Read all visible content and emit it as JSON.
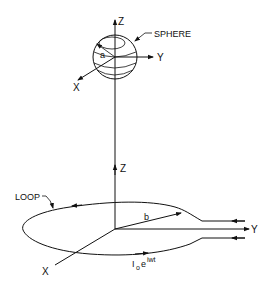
{
  "figure": {
    "type": "technical-line-diagram",
    "colors": {
      "line": "#111111",
      "background": "#ffffff"
    }
  },
  "sphere_frame": {
    "label": "SPHERE",
    "radius_label": "a",
    "axes": {
      "z": "Z",
      "y": "Y",
      "x": "X"
    }
  },
  "loop_frame": {
    "label": "LOOP",
    "radius_label": "b",
    "axes": {
      "z": "Z",
      "y": "Y",
      "x": "X"
    },
    "current_label": {
      "base": "I",
      "subscript": "o",
      "mid": "e",
      "superscript": "iwt"
    }
  }
}
